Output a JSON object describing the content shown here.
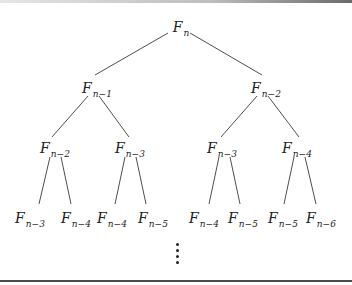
{
  "diagram": {
    "type": "tree",
    "nodes": [
      {
        "id": "n0",
        "base": "F",
        "sub": "n",
        "x": 181,
        "y": 27
      },
      {
        "id": "n1",
        "base": "F",
        "sub": "n−1",
        "x": 97,
        "y": 88
      },
      {
        "id": "n2",
        "base": "F",
        "sub": "n−2",
        "x": 266,
        "y": 88
      },
      {
        "id": "n3",
        "base": "F",
        "sub": "n−2",
        "x": 55,
        "y": 148
      },
      {
        "id": "n4",
        "base": "F",
        "sub": "n−3",
        "x": 130,
        "y": 148
      },
      {
        "id": "n5",
        "base": "F",
        "sub": "n−3",
        "x": 222,
        "y": 148
      },
      {
        "id": "n6",
        "base": "F",
        "sub": "n−4",
        "x": 297,
        "y": 148
      },
      {
        "id": "n7",
        "base": "F",
        "sub": "n−3",
        "x": 30,
        "y": 218
      },
      {
        "id": "n8",
        "base": "F",
        "sub": "n−4",
        "x": 76,
        "y": 218
      },
      {
        "id": "n9",
        "base": "F",
        "sub": "n−4",
        "x": 112,
        "y": 218
      },
      {
        "id": "n10",
        "base": "F",
        "sub": "n−5",
        "x": 153,
        "y": 218
      },
      {
        "id": "n11",
        "base": "F",
        "sub": "n−4",
        "x": 204,
        "y": 218
      },
      {
        "id": "n12",
        "base": "F",
        "sub": "n−5",
        "x": 243,
        "y": 218
      },
      {
        "id": "n13",
        "base": "F",
        "sub": "n−5",
        "x": 283,
        "y": 218
      },
      {
        "id": "n14",
        "base": "F",
        "sub": "n−6",
        "x": 321,
        "y": 218
      }
    ],
    "edges": [
      {
        "x1": 168,
        "y1": 33,
        "x2": 95,
        "y2": 75
      },
      {
        "x1": 190,
        "y1": 33,
        "x2": 262,
        "y2": 75
      },
      {
        "x1": 88,
        "y1": 96,
        "x2": 52,
        "y2": 137
      },
      {
        "x1": 99,
        "y1": 96,
        "x2": 129,
        "y2": 137
      },
      {
        "x1": 257,
        "y1": 96,
        "x2": 221,
        "y2": 137
      },
      {
        "x1": 268,
        "y1": 96,
        "x2": 299,
        "y2": 137
      },
      {
        "x1": 50,
        "y1": 157,
        "x2": 39,
        "y2": 204
      },
      {
        "x1": 61,
        "y1": 157,
        "x2": 71,
        "y2": 204
      },
      {
        "x1": 125,
        "y1": 157,
        "x2": 115,
        "y2": 204
      },
      {
        "x1": 136,
        "y1": 157,
        "x2": 146,
        "y2": 204
      },
      {
        "x1": 219,
        "y1": 157,
        "x2": 209,
        "y2": 204
      },
      {
        "x1": 230,
        "y1": 157,
        "x2": 240,
        "y2": 204
      },
      {
        "x1": 294,
        "y1": 157,
        "x2": 284,
        "y2": 204
      },
      {
        "x1": 305,
        "y1": 157,
        "x2": 316,
        "y2": 204
      }
    ],
    "continuation": "⋮",
    "dot_count": 4
  }
}
